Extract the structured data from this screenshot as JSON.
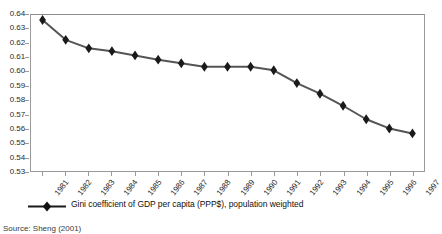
{
  "chart_data": {
    "type": "line",
    "title": "",
    "subtitle": "",
    "xlabel": "",
    "ylabel": "",
    "grid": false,
    "legend_position": "bottom-left",
    "ylim": [
      0.53,
      0.64
    ],
    "ytick_step": 0.01,
    "categories": [
      "1981",
      "1982",
      "1983",
      "1984",
      "1985",
      "1986",
      "1987",
      "1988",
      "1989",
      "1990",
      "1991",
      "1992",
      "1993",
      "1994",
      "1995",
      "1996",
      "1997"
    ],
    "ytick_labels": [
      "0.64",
      "0.63",
      "0.62",
      "0.61",
      "0.60",
      "0.59",
      "0.58",
      "0.57",
      "0.56",
      "0.55",
      "0.54",
      "0.53"
    ],
    "series": [
      {
        "name": "Gini coefficient of GDP per capita (PPP$), population weighted",
        "marker": "diamond",
        "color": "#1a1a1a",
        "values": [
          0.6365,
          0.6225,
          0.6165,
          0.6145,
          0.6115,
          0.6085,
          0.606,
          0.6035,
          0.6035,
          0.6035,
          0.601,
          0.592,
          0.5845,
          0.576,
          0.5665,
          0.56,
          0.5565
        ]
      }
    ]
  },
  "legend": {
    "entry_label": "Gini coefficient of GDP per capita (PPP$), population weighted"
  },
  "source": {
    "note": "Source: Sheng (2001)"
  }
}
